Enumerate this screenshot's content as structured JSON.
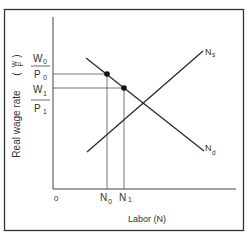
{
  "diagram": {
    "y_axis_label": "Real wage rate",
    "y_axis_symbol_num": "W",
    "y_axis_symbol_den": "P",
    "x_axis_label": "Labor (N)",
    "origin_label": "0",
    "wage_levels": [
      {
        "num": "W",
        "num_sub": "0",
        "den": "P",
        "den_sub": "0"
      },
      {
        "num": "W",
        "num_sub": "1",
        "den": "P",
        "den_sub": "1"
      }
    ],
    "labor_levels": [
      {
        "label": "N",
        "sub": "0"
      },
      {
        "label": "N",
        "sub": "1"
      }
    ],
    "curves": [
      {
        "label": "N",
        "sub": "s",
        "name": "labor supply"
      },
      {
        "label": "N",
        "sub": "d",
        "name": "labor demand"
      }
    ],
    "colors": {
      "line": "#2a2a2a",
      "frame": "#333333",
      "guide": "#555555",
      "text": "#333333"
    }
  }
}
